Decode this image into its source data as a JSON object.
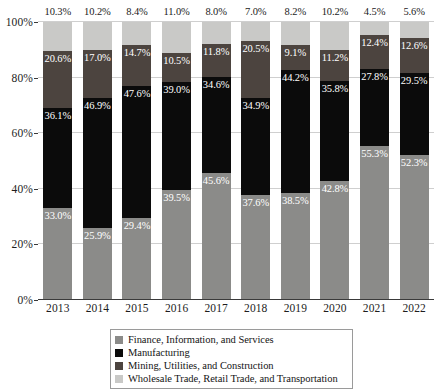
{
  "chart_data": {
    "type": "bar",
    "subtype": "stacked-100-percent",
    "title": "",
    "xlabel": "",
    "ylabel": "",
    "ylim": [
      0,
      100
    ],
    "ytick_labels": [
      "0%",
      "20%",
      "40%",
      "60%",
      "80%",
      "100%"
    ],
    "ytick_values": [
      0,
      20,
      40,
      60,
      80,
      100
    ],
    "grid": true,
    "legend_position": "bottom",
    "categories": [
      "2013",
      "2014",
      "2015",
      "2016",
      "2017",
      "2018",
      "2019",
      "2020",
      "2021",
      "2022"
    ],
    "series": [
      {
        "name": "Finance, Information, and Services",
        "color": "#8b8b89",
        "values": [
          33.0,
          25.9,
          29.4,
          39.5,
          45.6,
          37.6,
          38.5,
          42.8,
          55.3,
          52.3
        ],
        "labels": [
          "33.0%",
          "25.9%",
          "29.4%",
          "39.5%",
          "45.6%",
          "37.6%",
          "38.5%",
          "42.8%",
          "55.3%",
          "52.3%"
        ]
      },
      {
        "name": "Manufacturing",
        "color": "#0b0b0b",
        "values": [
          36.1,
          46.9,
          47.6,
          39.0,
          34.6,
          34.9,
          44.2,
          35.8,
          27.8,
          29.5
        ],
        "labels": [
          "36.1%",
          "46.9%",
          "47.6%",
          "39.0%",
          "34.6%",
          "34.9%",
          "44.2%",
          "35.8%",
          "27.8%",
          "29.5%"
        ]
      },
      {
        "name": "Mining, Utilities, and Construction",
        "color": "#4c443f",
        "values": [
          20.6,
          17.0,
          14.7,
          10.5,
          11.8,
          20.5,
          9.1,
          11.2,
          12.4,
          12.6
        ],
        "labels": [
          "20.6%",
          "17.0%",
          "14.7%",
          "10.5%",
          "11.8%",
          "20.5%",
          "9.1%",
          "11.2%",
          "12.4%",
          "12.6%"
        ]
      },
      {
        "name": "Wholesale Trade, Retail Trade, and Transportation",
        "color": "#c9c9c7",
        "values": [
          10.3,
          10.2,
          8.4,
          11.0,
          8.0,
          7.0,
          8.2,
          10.2,
          4.5,
          5.6
        ],
        "labels": [
          "10.3%",
          "10.2%",
          "8.4%",
          "11.0%",
          "8.0%",
          "7.0%",
          "8.2%",
          "10.2%",
          "4.5%",
          "5.6%"
        ]
      }
    ]
  },
  "legend": {
    "items": [
      {
        "label": "Finance, Information, and Services",
        "color": "#8b8b89"
      },
      {
        "label": "Manufacturing",
        "color": "#0b0b0b"
      },
      {
        "label": "Mining, Utilities, and Construction",
        "color": "#4c443f"
      },
      {
        "label": "Wholesale Trade, Retail Trade, and Transportation",
        "color": "#c9c9c7"
      }
    ]
  },
  "colors": {
    "finance": "#8b8b89",
    "manufacturing": "#0b0b0b",
    "mining": "#4c443f",
    "wholesale": "#c9c9c7",
    "grid": "#cfcfcf",
    "axis": "#3a3a3a",
    "text": "#1d1d1d"
  }
}
